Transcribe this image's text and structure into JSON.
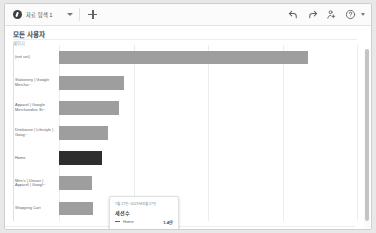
{
  "toolbar": {
    "tab_label": "자료 탐색 1",
    "tab_badge_icon": "explore-badge-icon",
    "tab_caret_icon": "chevron-down-icon",
    "add_tab_icon": "plus-icon",
    "actions": [
      {
        "name": "undo",
        "icon": "undo-icon"
      },
      {
        "name": "redo",
        "icon": "redo-icon"
      },
      {
        "name": "share",
        "icon": "person-share-icon"
      },
      {
        "name": "help",
        "icon": "help-circle-icon"
      }
    ],
    "overflow_caret_icon": "chevron-down-icon"
  },
  "report": {
    "title": "모든 사용자",
    "dimension_axis_label": "페이지"
  },
  "tooltip": {
    "date_range": "7월 27일~2023년 8월 27일",
    "metric_label": "세션수",
    "series_name": "Home",
    "series_value": "1.4만",
    "swatch_color": "#5f6368"
  },
  "colors": {
    "bar": "#9e9e9e",
    "bar_highlight": "#2e2e2e",
    "gridline": "#ececec",
    "text": "#5f6368"
  },
  "chart_data": {
    "type": "bar",
    "orientation": "horizontal",
    "title": "모든 사용자",
    "xlabel": "세션수",
    "ylabel": "페이지",
    "grid": true,
    "legend": "none",
    "xlim": [
      0,
      40000
    ],
    "gridline_values": [
      0,
      10000,
      20000,
      30000,
      40000
    ],
    "categories": [
      "(not set)",
      "Stationery | Google Mercha~",
      "Apparel | Google Merchandise St~",
      "Drinkware | Lifestyle | Goog~",
      "Home",
      "Men's | Unisex | Apparel | Googl~",
      "Shopping Cart"
    ],
    "values": [
      33400,
      8700,
      8100,
      6600,
      5800,
      4400,
      4600
    ],
    "highlighted_category": "Home",
    "highlight_value_label": "1.4만"
  }
}
